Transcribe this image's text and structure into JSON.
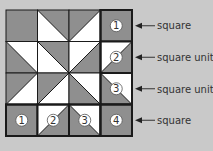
{
  "colors": {
    "background": "#c9c9c9",
    "gray_fill": "#8f8f8f",
    "white_fill": "#ffffff",
    "line": "#1a1a1a"
  },
  "grid": {
    "rows": 4,
    "cols": 4,
    "cells": [
      [
        {
          "type": "solid"
        },
        {
          "type": "tri",
          "diag": "TLBR",
          "gray": "upper"
        },
        {
          "type": "tri",
          "diag": "TRBL",
          "gray": "upper"
        },
        {
          "type": "solid",
          "num": "1",
          "bold": true
        }
      ],
      [
        {
          "type": "tri",
          "diag": "TLBR",
          "gray": "lower"
        },
        {
          "type": "tri",
          "diag": "TLBR",
          "gray": "upper"
        },
        {
          "type": "tri",
          "diag": "TRBL",
          "gray": "lower"
        },
        {
          "type": "tri",
          "diag": "TRBL",
          "gray": "lower",
          "num": "2",
          "bold": true
        }
      ],
      [
        {
          "type": "tri",
          "diag": "TRBL",
          "gray": "upper"
        },
        {
          "type": "tri",
          "diag": "TRBL",
          "gray": "upper"
        },
        {
          "type": "tri",
          "diag": "TLBR",
          "gray": "lower"
        },
        {
          "type": "tri",
          "diag": "TLBR",
          "gray": "lower",
          "num": "3",
          "bold": true
        }
      ],
      [
        {
          "type": "solid",
          "num": "1",
          "bold": true
        },
        {
          "type": "tri",
          "diag": "TRBL",
          "gray": "lower",
          "num": "2",
          "bold": true
        },
        {
          "type": "tri",
          "diag": "TLBR",
          "gray": "lower",
          "num": "3",
          "bold": true
        },
        {
          "type": "solid",
          "num": "4",
          "bold": true
        }
      ]
    ]
  },
  "annotations": [
    {
      "text": "square",
      "row": 0
    },
    {
      "text": "square unit",
      "row": 1
    },
    {
      "text": "square unit",
      "row": 2
    },
    {
      "text": "square",
      "row": 3
    }
  ]
}
